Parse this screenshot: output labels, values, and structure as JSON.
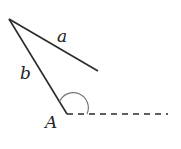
{
  "diagram": {
    "type": "geometry-angle",
    "labels": {
      "side_a": "a",
      "side_b": "b",
      "vertex": "A"
    },
    "colors": {
      "stroke": "#2a2a2a",
      "arc": "#777777",
      "background": "#ffffff"
    },
    "points": {
      "apex": [
        9,
        19
      ],
      "a_end": [
        98,
        71
      ],
      "vertex_A": [
        67,
        114
      ],
      "dash_end": [
        168,
        114
      ]
    },
    "elements": [
      {
        "kind": "segment",
        "name": "side-a",
        "from": "apex",
        "to": "a_end",
        "label": "a"
      },
      {
        "kind": "segment",
        "name": "side-b",
        "from": "apex",
        "to": "vertex_A",
        "label": "b"
      },
      {
        "kind": "dashed-ray",
        "name": "extension",
        "from": "vertex_A",
        "to": "dash_end"
      },
      {
        "kind": "angle-arc",
        "name": "angle-A",
        "at": "vertex_A"
      }
    ]
  }
}
